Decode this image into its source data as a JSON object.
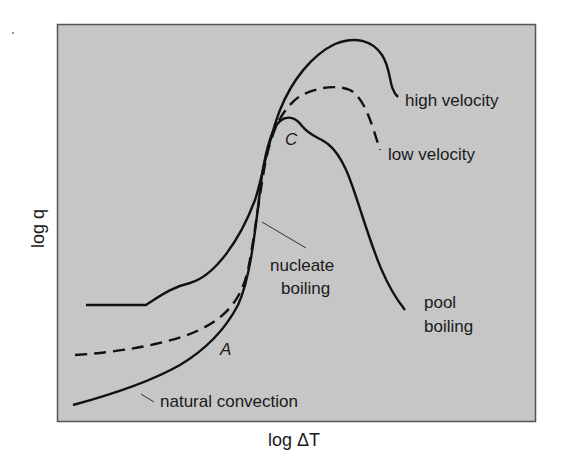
{
  "figure": {
    "plot_background": "#c6c6c6",
    "frame_color": "#555555",
    "line_color": "#111111",
    "axes": {
      "x_label": "log ΔT",
      "y_label": "log q"
    },
    "curves": [
      {
        "id": "high-velocity",
        "label": "high velocity",
        "style": "solid"
      },
      {
        "id": "low-velocity",
        "label": "low velocity",
        "style": "dashed"
      },
      {
        "id": "pool-boiling",
        "label_line1": "pool",
        "label_line2": "boiling",
        "style": "solid"
      }
    ],
    "annotations": {
      "point_c": "C",
      "point_a": "A",
      "nucleate_line1": "nucleate",
      "nucleate_line2": "boiling",
      "natural_convection": "natural convection"
    }
  }
}
